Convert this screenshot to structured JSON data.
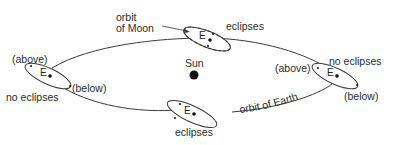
{
  "diagram": {
    "type": "lunar-eclipse-geometry",
    "colors": {
      "line": "#3a3a3a",
      "text": "#2a2a2a",
      "sun": "#111111",
      "background": "#ffffff"
    },
    "sun": {
      "label": "Sun"
    },
    "earth_symbol": "E",
    "labels": {
      "orbit_moon_line1": "orbit",
      "orbit_moon_line2": "of Moon",
      "orbit_earth": "orbit of Earth",
      "top_eclipses": "eclipses",
      "bottom_eclipses": "eclipses",
      "left_above": "(above)",
      "left_below": "(below)",
      "left_no_eclipses": "no eclipses",
      "right_above": "(above)",
      "right_below": "(below)",
      "right_no_eclipses": "no eclipses"
    },
    "positions": [
      {
        "name": "top",
        "label": "eclipses"
      },
      {
        "name": "left",
        "label": "no eclipses",
        "moon_positions": [
          "(above)",
          "(below)"
        ]
      },
      {
        "name": "bottom",
        "label": "eclipses"
      },
      {
        "name": "right",
        "label": "no eclipses",
        "moon_positions": [
          "(above)",
          "(below)"
        ]
      }
    ]
  }
}
